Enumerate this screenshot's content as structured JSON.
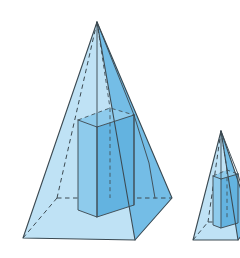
{
  "figure": {
    "title": "Two similar square pyramids each containing an inscribed rectangular prism",
    "background_color": "#ffffff",
    "canvas": {
      "width": 240,
      "height": 258
    },
    "palette": {
      "face_light": "#bfe2f5",
      "face_mid": "#8ecbec",
      "face_dark": "#74bde6",
      "face_deep": "#63b3e0",
      "edge_color": "#3c4a52",
      "hidden_edge_color": "#3c4a52"
    },
    "shapes": [
      {
        "id": "large-pyramid",
        "name": "large-square-pyramid",
        "label": "Large pyramid",
        "apex": [
          97,
          22
        ],
        "base_front": [
          135,
          240
        ],
        "base_left": [
          23,
          238
        ],
        "base_right": [
          172,
          198
        ],
        "base_back_hidden": [
          57,
          198
        ],
        "inscribed_prism": {
          "name": "inscribed-rectangular-prism",
          "top_front": [
            97,
            127
          ],
          "top_left": [
            78,
            120
          ],
          "top_right": [
            134,
            115
          ],
          "top_back_hidden": [
            110,
            108
          ],
          "bottom_front": [
            97,
            217
          ],
          "bottom_left": [
            78,
            210
          ],
          "bottom_right": [
            134,
            205
          ],
          "bottom_back_hidden": [
            110,
            198
          ]
        }
      },
      {
        "id": "small-pyramid",
        "name": "small-square-pyramid",
        "label": "Small pyramid",
        "apex": [
          221,
          131
        ],
        "base_front": [
          238,
          240
        ],
        "base_left": [
          193,
          240
        ],
        "base_right": [
          252,
          222
        ],
        "base_back_hidden": [
          208,
          222
        ],
        "inscribed_prism": {
          "name": "inscribed-rectangular-prism-small",
          "top_front": [
            221,
            179
          ],
          "top_left": [
            213,
            176
          ],
          "top_right": [
            238,
            174
          ],
          "top_back_hidden": [
            227,
            170
          ],
          "bottom_front": [
            221,
            228
          ],
          "bottom_left": [
            213,
            225
          ],
          "bottom_right": [
            238,
            223
          ],
          "bottom_back_hidden": [
            227,
            219
          ]
        },
        "clipped_at_right_edge": true
      }
    ]
  }
}
